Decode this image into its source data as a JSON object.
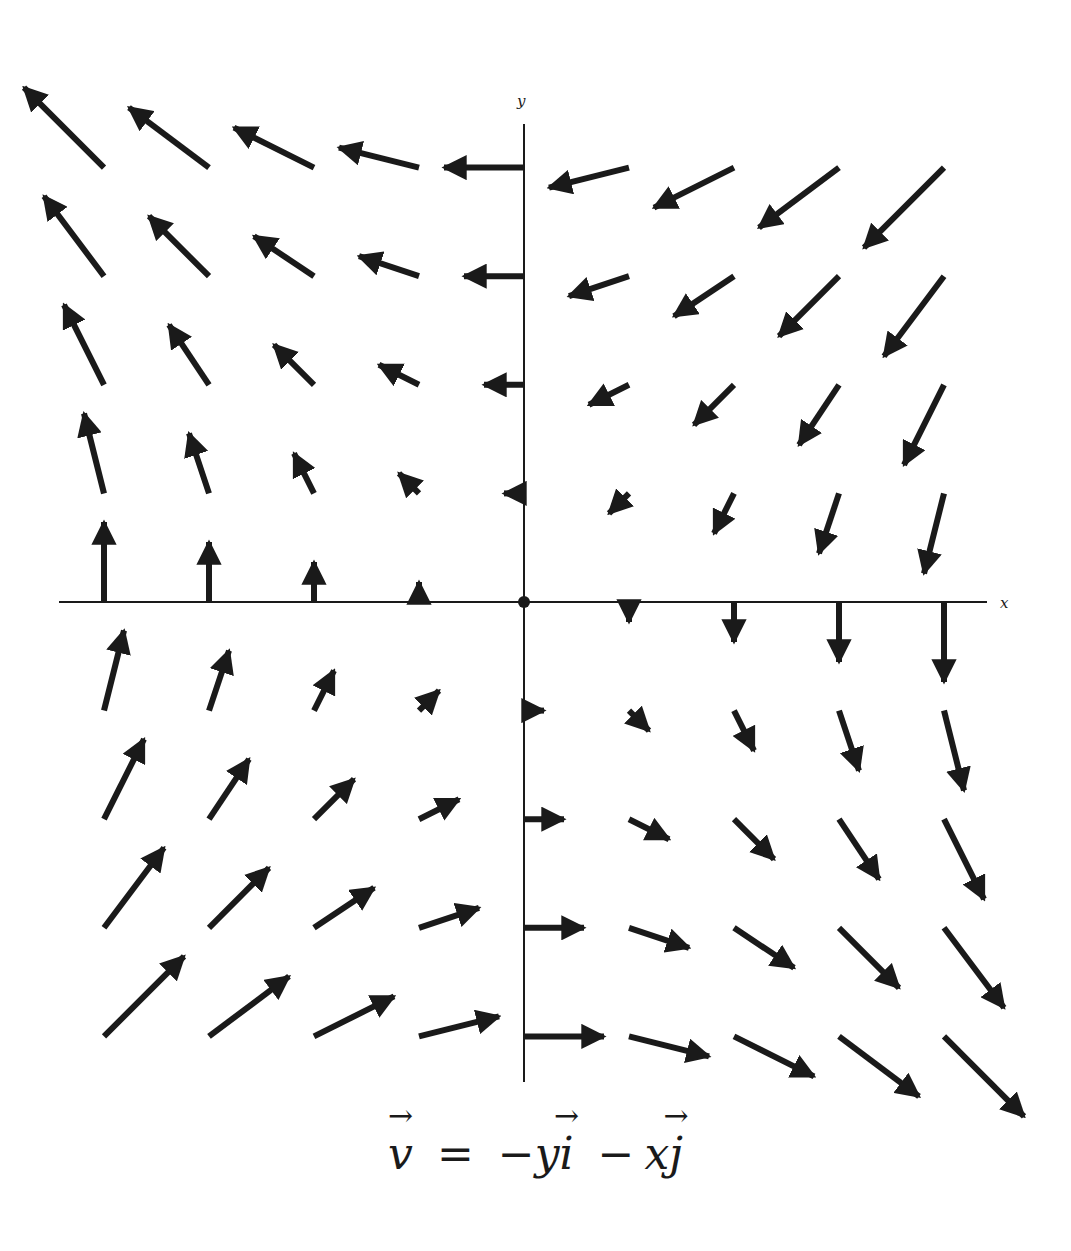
{
  "figure": {
    "caption": {
      "lhs": "v",
      "equals": "=",
      "term1_sign": "−",
      "term1_coef": "y",
      "term1_unit": "i",
      "term2_sign": "−",
      "term2_coef": "x",
      "term2_unit": "j"
    },
    "x_axis_label": "x",
    "y_axis_label": "y",
    "colors": {
      "arrow": "#1a1a1a",
      "axis": "#1a1a1a",
      "background": "#ffffff"
    }
  },
  "chart_data": {
    "type": "vector_field",
    "field": {
      "u": "-y",
      "v": "-x"
    },
    "xlabel": "x",
    "ylabel": "y",
    "grid_x": [
      -4,
      -3,
      -2,
      -1,
      0,
      1,
      2,
      3,
      4
    ],
    "grid_y": [
      -4,
      -3,
      -2,
      -1,
      0,
      1,
      2,
      3,
      4
    ],
    "xlim": [
      -4.4,
      4.4
    ],
    "ylim": [
      -4.5,
      4.6
    ],
    "origin_marker": true,
    "grid": false
  }
}
